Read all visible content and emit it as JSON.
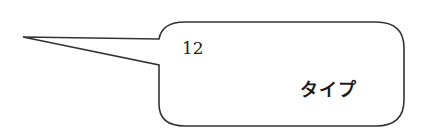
{
  "callout": {
    "number": "12",
    "label": "タイプ"
  },
  "colors": {
    "stroke": "#333333",
    "fill": "#ffffff",
    "text": "#1a1a1a"
  }
}
